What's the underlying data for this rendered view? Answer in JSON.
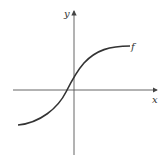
{
  "diagram": {
    "type": "function-graph",
    "function_label": "f",
    "x_axis_label": "x",
    "y_axis_label": "y",
    "curve_shape": "increasing S-shaped (sigmoid-like) curve crossing x-axis left of origin",
    "colors": {
      "axes": "#555555",
      "curve": "#333333",
      "background": "#ffffff"
    }
  }
}
